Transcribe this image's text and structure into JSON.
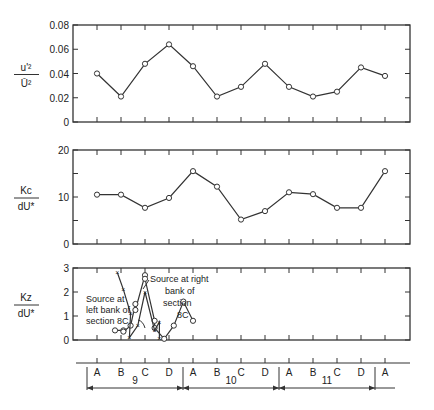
{
  "chart_data": [
    {
      "type": "line",
      "panel": "top",
      "ylabel_num": "u'²",
      "ylabel_den": "Ū²",
      "ylim": [
        0,
        0.08
      ],
      "yticks": [
        "0",
        "0.02",
        "0.04",
        "0.06",
        "0.08"
      ],
      "categories": [
        "9A",
        "9B",
        "9C",
        "9D",
        "10A",
        "10B",
        "10C",
        "10D",
        "11A",
        "11B",
        "11C",
        "11D",
        "12A"
      ],
      "series": [
        {
          "name": "u'^2/U^2",
          "marker": "circle",
          "values": [
            0.04,
            0.021,
            0.048,
            0.064,
            0.046,
            0.021,
            0.029,
            0.048,
            0.029,
            0.021,
            0.025,
            0.045,
            0.038
          ]
        }
      ]
    },
    {
      "type": "line",
      "panel": "middle",
      "ylabel_num": "Kc",
      "ylabel_den": "dU*",
      "ylim": [
        0,
        20
      ],
      "yticks": [
        "0",
        "10",
        "20"
      ],
      "categories": [
        "9A",
        "9B",
        "9C",
        "9D",
        "10A",
        "10B",
        "10C",
        "10D",
        "11A",
        "11B",
        "11C",
        "11D",
        "12A"
      ],
      "series": [
        {
          "name": "Kc/dU*",
          "marker": "circle",
          "values": [
            10.5,
            10.5,
            7.7,
            9.8,
            15.5,
            12.2,
            5.2,
            7.0,
            11.0,
            10.6,
            7.7,
            7.7,
            15.5
          ]
        }
      ]
    },
    {
      "type": "line",
      "panel": "bottom",
      "ylabel_num": "Kz",
      "ylabel_den": "dU*",
      "ylim": [
        0,
        3
      ],
      "yticks": [
        "0",
        "1",
        "2",
        "3"
      ],
      "series": [
        {
          "name": "Source at left bank of section 8C",
          "marker": "circle",
          "points": [
            [
              9.75,
              0.4
            ],
            [
              10.1,
              0.4
            ],
            [
              10.1,
              0.35
            ],
            [
              10.4,
              0.6
            ],
            [
              10.6,
              1.5
            ],
            [
              10.6,
              1.25
            ],
            [
              11.0,
              2.7
            ],
            [
              11.0,
              2.55
            ],
            [
              11.4,
              0.8
            ],
            [
              11.4,
              0.5
            ],
            [
              11.8,
              0.05
            ],
            [
              12.2,
              0.6
            ],
            [
              12.6,
              1.6
            ],
            [
              13.0,
              0.8
            ]
          ]
        },
        {
          "name": "Source at right bank of section 8C",
          "marker": "x",
          "points": [
            [
              9.85,
              2.8
            ],
            [
              10.1,
              2.1
            ],
            [
              10.4,
              1.1
            ],
            [
              10.35,
              0.1
            ],
            [
              10.7,
              0.6
            ],
            [
              11.0,
              2.0
            ],
            [
              11.4,
              0.4
            ],
            [
              11.6,
              0.75
            ],
            [
              11.6,
              0.05
            ]
          ]
        }
      ],
      "annotations": [
        {
          "text_lines": [
            "Source at right",
            "bank of",
            "section",
            "8C"
          ]
        },
        {
          "text_lines": [
            "Source at",
            "left bank of",
            "section  8C"
          ]
        }
      ]
    }
  ],
  "xaxis": {
    "letters": [
      "A",
      "B",
      "C",
      "D",
      "A",
      "B",
      "C",
      "D",
      "A",
      "B",
      "C",
      "D",
      "A"
    ],
    "sections": [
      "9",
      "10",
      "11"
    ]
  }
}
